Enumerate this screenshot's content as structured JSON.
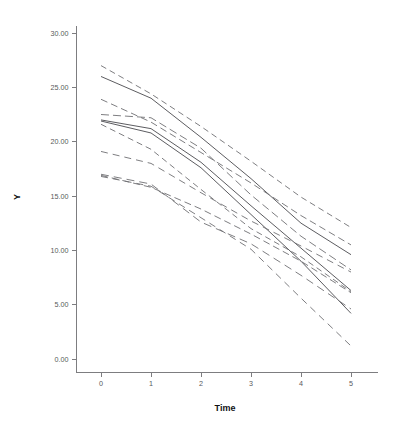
{
  "chart": {
    "title": "",
    "background_color": "#ffffff",
    "axis_color": "#7d7d80",
    "tick_label_color": "#58585a",
    "axis_title_color": "#111114"
  },
  "axes": {
    "x_title": "Time",
    "y_title": "Y",
    "x_ticks": [
      "0",
      "1",
      "2",
      "3",
      "4",
      "5"
    ],
    "y_ticks": [
      "0.00",
      "5.00",
      "10.00",
      "15.00",
      "20.00",
      "25.00",
      "30.00"
    ]
  },
  "chart_data": {
    "type": "line",
    "title": "",
    "xlabel": "Time",
    "ylabel": "Y",
    "xlim": [
      -0.55,
      5.55
    ],
    "ylim": [
      -1.2,
      31.6
    ],
    "x": [
      0,
      1,
      2,
      3,
      4,
      5
    ],
    "xtick_values": [
      0,
      1,
      2,
      3,
      4,
      5
    ],
    "ytick_values": [
      0,
      5,
      10,
      15,
      20,
      25,
      30
    ],
    "grid": false,
    "legend": "none",
    "series": [
      {
        "name": "subject-1",
        "color": "#6f6f73",
        "dash": "6,4",
        "width": 0.9,
        "values": [
          27.0,
          24.4,
          21.4,
          18.2,
          14.9,
          12.1
        ]
      },
      {
        "name": "subject-2",
        "color": "#4a4a4e",
        "dash": "none",
        "width": 0.9,
        "values": [
          26.0,
          24.0,
          20.4,
          16.6,
          12.5,
          9.6
        ]
      },
      {
        "name": "subject-3",
        "color": "#6f6f73",
        "dash": "7,4",
        "width": 0.9,
        "values": [
          23.9,
          21.8,
          19.0,
          16.2,
          13.2,
          10.5
        ]
      },
      {
        "name": "subject-4",
        "color": "#6f6f73",
        "dash": "8,4",
        "width": 0.9,
        "values": [
          22.5,
          22.2,
          19.4,
          15.1,
          11.3,
          8.2
        ]
      },
      {
        "name": "subject-5",
        "color": "#4a4a4e",
        "dash": "none",
        "width": 0.9,
        "values": [
          22.0,
          21.2,
          18.1,
          14.1,
          10.2,
          6.3
        ]
      },
      {
        "name": "subject-6",
        "color": "#4a4a4e",
        "dash": "none",
        "width": 0.9,
        "values": [
          21.9,
          20.8,
          17.6,
          13.3,
          9.0,
          4.2
        ]
      },
      {
        "name": "subject-7",
        "color": "#6f6f73",
        "dash": "6,4",
        "width": 0.9,
        "values": [
          21.6,
          19.3,
          15.6,
          12.0,
          9.4,
          6.2
        ]
      },
      {
        "name": "subject-8",
        "color": "#6f6f73",
        "dash": "7,5",
        "width": 0.9,
        "values": [
          19.1,
          18.0,
          15.3,
          12.7,
          10.4,
          8.0
        ]
      },
      {
        "name": "subject-9",
        "color": "#6f6f73",
        "dash": "8,5",
        "width": 0.9,
        "values": [
          17.0,
          16.1,
          12.6,
          10.6,
          7.7,
          4.6
        ]
      },
      {
        "name": "subject-10",
        "color": "#6f6f73",
        "dash": "7,4",
        "width": 0.9,
        "values": [
          16.9,
          15.8,
          13.8,
          11.5,
          9.0,
          6.1
        ]
      },
      {
        "name": "subject-11",
        "color": "#6f6f73",
        "dash": "7,5",
        "width": 0.9,
        "values": [
          16.8,
          15.9,
          13.0,
          10.1,
          5.6,
          1.2
        ]
      }
    ]
  }
}
